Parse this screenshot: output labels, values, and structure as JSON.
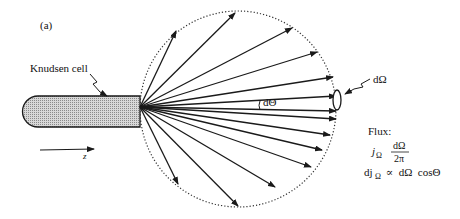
{
  "figure": {
    "panel_label": "(a)",
    "cell_label": "Knudsen cell",
    "axis_label": "z",
    "solid_angle_label": "dΩ",
    "angle_label": "dΘ",
    "flux": {
      "title": "Flux:",
      "line1_symbol": "j",
      "line1_sub": "Ω",
      "line1_num": "dΩ",
      "line1_den": "2π",
      "line2_prefix": "dj",
      "line2_sub": "Ω",
      "line2_rest": " ∝  dΩ  cosΘ"
    }
  },
  "colors": {
    "line": "#1a1a1a",
    "cell_fill": "#c4c4c4",
    "background": "#ffffff"
  },
  "geometry": {
    "origin": [
      140,
      107
    ],
    "circle_center": [
      238,
      109
    ],
    "circle_radius": 98,
    "ray_endpoints": [
      [
        176,
        31
      ],
      [
        235,
        13
      ],
      [
        292,
        28
      ],
      [
        317,
        52
      ],
      [
        333,
        77
      ],
      [
        336,
        96
      ],
      [
        336,
        111
      ],
      [
        336,
        119
      ],
      [
        330,
        135
      ],
      [
        322,
        150
      ],
      [
        311,
        167
      ],
      [
        275,
        187
      ],
      [
        238,
        206
      ],
      [
        178,
        184
      ]
    ]
  }
}
